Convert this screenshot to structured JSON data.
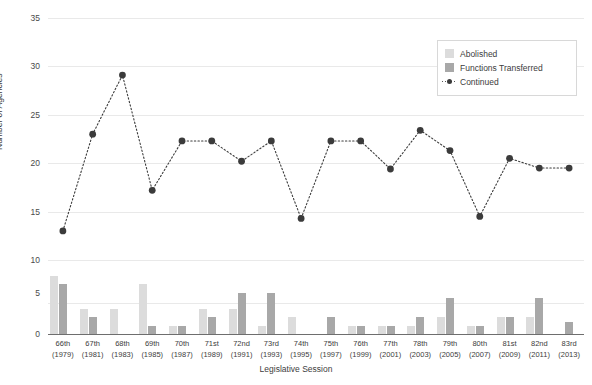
{
  "chart_data": {
    "type": "line",
    "title": "",
    "xlabel": "Legislative Session",
    "ylabel": "Number of Agencies",
    "ylim": [
      10,
      35
    ],
    "yticks": [
      10,
      15,
      20,
      25,
      30,
      35
    ],
    "grid": true,
    "legend_position": "top-right",
    "categories": [
      "66th",
      "67th",
      "68th",
      "69th",
      "70th",
      "71st",
      "72nd",
      "73rd",
      "74th",
      "75th",
      "76th",
      "77th",
      "78th",
      "79th",
      "80th",
      "81st",
      "82nd",
      "83rd"
    ],
    "category_years": [
      "(1979)",
      "(1981)",
      "(1983)",
      "(1985)",
      "(1987)",
      "(1989)",
      "(1991)",
      "(1993)",
      "(1995)",
      "(1997)",
      "(1999)",
      "(2001)",
      "(2003)",
      "(2005)",
      "(2007)",
      "(2009)",
      "(2011)",
      "(2013)"
    ],
    "series": [
      {
        "name": "Continued",
        "type": "line",
        "panel": "top",
        "color": "#3b3b3b",
        "linestyle": "dotted",
        "marker": "circle",
        "values": [
          13.0,
          23.0,
          29.1,
          17.2,
          22.3,
          22.3,
          20.2,
          22.3,
          14.3,
          22.3,
          22.3,
          19.4,
          23.4,
          21.3,
          14.5,
          20.5,
          19.5,
          19.5
        ]
      },
      {
        "name": "Abolished",
        "type": "bar",
        "panel": "bottom",
        "color": "#dcdcdc",
        "values": [
          7,
          3,
          3,
          6,
          1,
          3,
          3,
          1,
          2,
          0,
          1,
          1,
          1,
          2,
          1,
          2,
          2,
          0
        ]
      },
      {
        "name": "Functions Transferred",
        "type": "bar",
        "panel": "bottom",
        "color": "#a8a8a8",
        "values": [
          6,
          2,
          0,
          1,
          1,
          2,
          5,
          5,
          0,
          2,
          1,
          1,
          2,
          4.3,
          1,
          2,
          4.4,
          1.5
        ]
      }
    ],
    "bar_panel": {
      "ylim": [
        0,
        7.5
      ],
      "yticks": [
        0,
        5
      ],
      "ytick_labels": [
        "0",
        "5"
      ]
    }
  },
  "legend": {
    "items": [
      {
        "label": "Abolished",
        "color": "#dcdcdc",
        "marker": "square"
      },
      {
        "label": "Functions Transferred",
        "color": "#a8a8a8",
        "marker": "square"
      },
      {
        "label": "Continued",
        "color": "#3b3b3b",
        "marker": "dotted-line-circle"
      }
    ]
  },
  "axes": {
    "y_title": "Number of Agencies",
    "x_title": "Legislative Session",
    "y_tick_labels": [
      "35",
      "30",
      "25",
      "20",
      "15",
      "10"
    ],
    "bar_y_tick_labels": [
      "5",
      "0"
    ]
  }
}
